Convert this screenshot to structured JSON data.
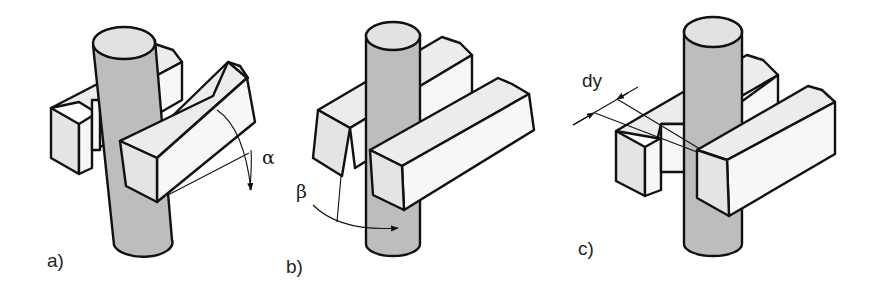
{
  "figure": {
    "panels": [
      {
        "id": "a",
        "label": "a)",
        "symbol": "α",
        "symbol_meaning": "angular misalignment of front block (rotation about horizontal axis)"
      },
      {
        "id": "b",
        "label": "b)",
        "symbol": "β",
        "symbol_meaning": "angular tilt of rod relative to block"
      },
      {
        "id": "c",
        "label": "c)",
        "symbol": "dy",
        "symbol_meaning": "lateral offset between blocks"
      }
    ],
    "colors": {
      "outline": "#111111",
      "rod_fill": "#bdbdbd",
      "rod_top": "#e2e2e2",
      "block_top": "#ececec",
      "block_front": "#f7f7f7",
      "background": "#ffffff"
    }
  }
}
